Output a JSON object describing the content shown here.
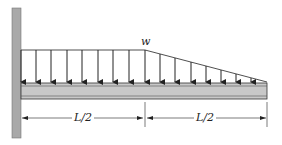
{
  "diagram": {
    "type": "cantilever-beam-load",
    "load_label": "w",
    "dimension_left": "L/2",
    "dimension_right": "L/2",
    "colors": {
      "wall": "#a9a9a9",
      "beam_fill": "#c8c8c8",
      "line": "#222222"
    },
    "load": {
      "uniform_segment": "0 to L/2",
      "linear_decreasing_segment": "L/2 to L",
      "arrow_count": 16
    }
  }
}
